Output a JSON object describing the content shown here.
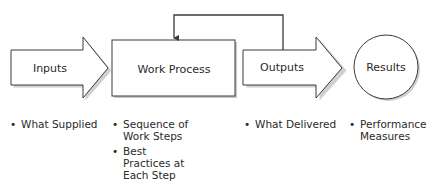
{
  "diagram": {
    "nodes": [
      {
        "id": "inputs",
        "shape": "arrow",
        "label": "Inputs"
      },
      {
        "id": "work_process",
        "shape": "rectangle",
        "label": "Work Process"
      },
      {
        "id": "outputs",
        "shape": "arrow",
        "label": "Outputs"
      },
      {
        "id": "results",
        "shape": "circle",
        "label": "Results"
      }
    ],
    "edges": [
      {
        "from": "inputs",
        "to": "work_process"
      },
      {
        "from": "work_process",
        "to": "outputs"
      },
      {
        "from": "outputs",
        "to": "results"
      },
      {
        "from": "outputs",
        "to": "work_process",
        "type": "feedback-loop"
      }
    ],
    "bullets": {
      "inputs": [
        "What Supplied"
      ],
      "work_process": [
        "Sequence of Work Steps",
        "Best Practices at Each Step"
      ],
      "outputs": [
        "What Delivered"
      ],
      "results": [
        "Performance Measures"
      ]
    }
  },
  "colors": {
    "stroke": "#3a3a3a",
    "fill": "#ffffff",
    "text": "#2a2a2a",
    "shadow": "#c8c8c8"
  }
}
